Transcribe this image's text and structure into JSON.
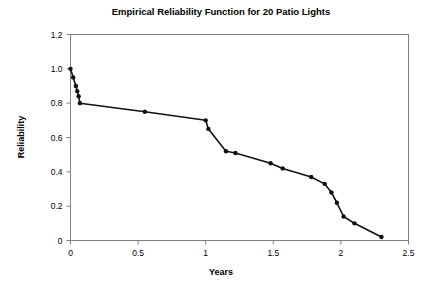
{
  "chart_data": {
    "type": "line",
    "title": "Empirical Reliability Function for 20 Patio Lights",
    "xlabel": "Years",
    "ylabel": "Reliability",
    "xlim": [
      0,
      2.5
    ],
    "ylim": [
      0,
      1.2
    ],
    "xticks": [
      0,
      0.5,
      1,
      1.5,
      2,
      2.5
    ],
    "xtick_labels": [
      "0",
      "0.5",
      "1",
      "1.5",
      "2",
      "2.5"
    ],
    "yticks": [
      0,
      0.2,
      0.4,
      0.6,
      0.8,
      1.0,
      1.2
    ],
    "ytick_labels": [
      "0",
      "0.2",
      "0.4",
      "0.6",
      "0.8",
      "1.0",
      "1.2"
    ],
    "grid": false,
    "legend": null,
    "marker": "filled-circle",
    "line_color": "#111111",
    "marker_color": "#111111",
    "frame_color": "#808080",
    "x": [
      0.0,
      0.02,
      0.04,
      0.05,
      0.06,
      0.07,
      0.55,
      1.0,
      1.02,
      1.15,
      1.22,
      1.48,
      1.57,
      1.78,
      1.88,
      1.93,
      1.97,
      2.02,
      2.1,
      2.3
    ],
    "y": [
      1.0,
      0.95,
      0.9,
      0.87,
      0.84,
      0.8,
      0.75,
      0.7,
      0.65,
      0.52,
      0.51,
      0.45,
      0.42,
      0.37,
      0.33,
      0.28,
      0.22,
      0.14,
      0.1,
      0.02
    ],
    "series": [
      {
        "name": "Empirical Reliability",
        "points": [
          [
            0.0,
            1.0
          ],
          [
            0.02,
            0.95
          ],
          [
            0.04,
            0.9
          ],
          [
            0.05,
            0.87
          ],
          [
            0.06,
            0.84
          ],
          [
            0.07,
            0.8
          ],
          [
            0.55,
            0.75
          ],
          [
            1.0,
            0.7
          ],
          [
            1.02,
            0.65
          ],
          [
            1.15,
            0.52
          ],
          [
            1.22,
            0.51
          ],
          [
            1.48,
            0.45
          ],
          [
            1.57,
            0.42
          ],
          [
            1.78,
            0.37
          ],
          [
            1.88,
            0.33
          ],
          [
            1.93,
            0.28
          ],
          [
            1.97,
            0.22
          ],
          [
            2.02,
            0.14
          ],
          [
            2.1,
            0.1
          ],
          [
            2.3,
            0.02
          ]
        ]
      }
    ]
  },
  "figure": {
    "background": "#ffffff"
  }
}
